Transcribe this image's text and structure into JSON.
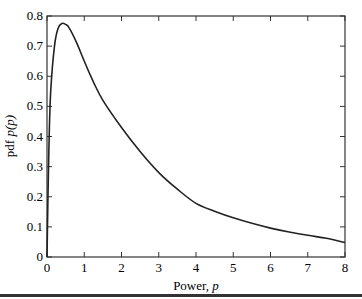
{
  "chart_data": {
    "type": "line",
    "title": "",
    "xlabel": "Power, p",
    "ylabel": "pdf p(p)",
    "xlim": [
      0,
      8
    ],
    "ylim": [
      0,
      0.8
    ],
    "xticks": [
      0,
      1,
      2,
      3,
      4,
      5,
      6,
      7,
      8
    ],
    "yticks": [
      0,
      0.1,
      0.2,
      0.3,
      0.4,
      0.5,
      0.6,
      0.7,
      0.8
    ],
    "xtick_labels": [
      "0",
      "1",
      "2",
      "3",
      "4",
      "5",
      "6",
      "7",
      "8"
    ],
    "ytick_labels": [
      "0",
      "0.1",
      "0.2",
      "0.3",
      "0.4",
      "0.5",
      "0.6",
      "0.7",
      "0.8"
    ],
    "grid": false,
    "legend": null,
    "series": [
      {
        "name": "pdf",
        "color": "#222222",
        "x": [
          0,
          0.05,
          0.1,
          0.2,
          0.3,
          0.4,
          0.5,
          0.6,
          0.8,
          1.0,
          1.25,
          1.5,
          2.0,
          2.5,
          3.0,
          3.5,
          4.0,
          4.5,
          5.0,
          5.5,
          6.0,
          6.5,
          7.0,
          7.5,
          8.0
        ],
        "y": [
          0,
          0.36,
          0.55,
          0.7,
          0.76,
          0.775,
          0.772,
          0.76,
          0.71,
          0.65,
          0.58,
          0.52,
          0.43,
          0.35,
          0.28,
          0.225,
          0.178,
          0.152,
          0.13,
          0.112,
          0.096,
          0.083,
          0.072,
          0.062,
          0.048
        ]
      }
    ]
  },
  "axes": {
    "xlabel_main": "Power, ",
    "xlabel_var": "p",
    "ylabel_main": "pdf ",
    "ylabel_var": "p(p)"
  }
}
